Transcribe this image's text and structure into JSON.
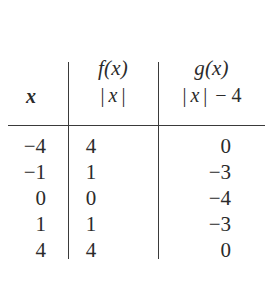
{
  "figure": {
    "kind": "function-value-table",
    "ink_color": "#2b2b2b",
    "rule_color": "#3a3a3a",
    "background_color": "#ffffff"
  },
  "headers": {
    "x": {
      "label": "x"
    },
    "f": {
      "name": "f(x)",
      "rule_open_bar": "|",
      "rule_variable": "x",
      "rule_close_bar": "|"
    },
    "g": {
      "name": "g(x)",
      "rule_open_bar": "|",
      "rule_variable": "x",
      "rule_close_bar": "|",
      "rule_tail": "− 4"
    }
  },
  "chart_data": {
    "type": "table",
    "title": "",
    "columns": [
      "x",
      "f(x) = |x|",
      "g(x) = |x| − 4"
    ],
    "x": [
      -4,
      -1,
      0,
      1,
      4
    ],
    "series": [
      {
        "name": "f(x) = |x|",
        "values": [
          4,
          1,
          0,
          1,
          4
        ]
      },
      {
        "name": "g(x) = |x| − 4",
        "values": [
          0,
          -3,
          -4,
          -3,
          0
        ]
      }
    ]
  },
  "rows": [
    {
      "x": "−4",
      "f": "4",
      "g": "0"
    },
    {
      "x": "−1",
      "f": "1",
      "g": "−3"
    },
    {
      "x": "0",
      "f": "0",
      "g": "−4"
    },
    {
      "x": "1",
      "f": "1",
      "g": "−3"
    },
    {
      "x": "4",
      "f": "4",
      "g": "0"
    }
  ]
}
